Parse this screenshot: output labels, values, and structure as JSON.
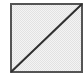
{
  "icon": {
    "name": "diagonal-border-icon",
    "description": "Square with diagonal line from bottom-left to top-right",
    "colors": {
      "fill": "#ebebeb",
      "fill_pattern": "#f6f6f6",
      "stroke": "#3a3a3a"
    }
  }
}
